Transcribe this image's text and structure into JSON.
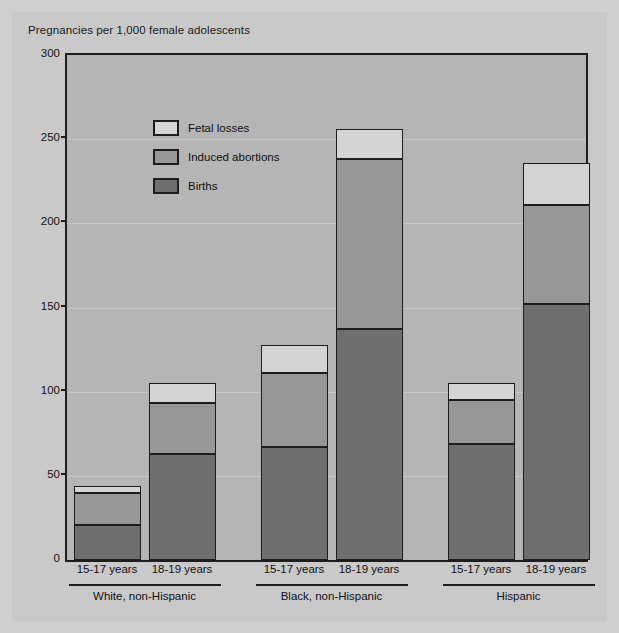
{
  "chart_data": {
    "type": "bar",
    "subtype": "stacked",
    "title": "Pregnancies per 1,000 female adolescents",
    "xlabel": "",
    "ylabel": "Pregnancies per 1,000 female adolescents",
    "ylim": [
      0,
      300
    ],
    "yticks": [
      0,
      50,
      100,
      150,
      200,
      250,
      300
    ],
    "ytick_labels": [
      "0",
      "50",
      "100",
      "150",
      "200",
      "250",
      "300"
    ],
    "grid": true,
    "legend_position": "upper-left-inside",
    "categories": [
      "15-17 years",
      "18-19 years",
      "15-17 years",
      "18-19 years",
      "15-17 years",
      "18-19 years"
    ],
    "groups": [
      {
        "label": "White, non-Hispanic",
        "categories": [
          "15-17 years",
          "18-19 years"
        ]
      },
      {
        "label": "Black, non-Hispanic",
        "categories": [
          "15-17 years",
          "18-19 years"
        ]
      },
      {
        "label": "Hispanic",
        "categories": [
          "15-17 years",
          "18-19 years"
        ]
      }
    ],
    "series": [
      {
        "name": "Births",
        "color": "#6f6f6f",
        "values": [
          21,
          63,
          67,
          137,
          69,
          152
        ]
      },
      {
        "name": "Induced abortions",
        "color": "#979797",
        "values": [
          19,
          30,
          44,
          101,
          26,
          59
        ]
      },
      {
        "name": "Fetal losses",
        "color": "#d4d4d4",
        "values": [
          4,
          12,
          17,
          18,
          10,
          25
        ]
      }
    ],
    "totals": [
      44,
      105,
      128,
      256,
      105,
      236
    ],
    "legend": [
      {
        "label": "Fetal losses",
        "color": "#d4d4d4"
      },
      {
        "label": "Induced abortions",
        "color": "#979797"
      },
      {
        "label": "Births",
        "color": "#6f6f6f"
      }
    ],
    "colors": {
      "page_background": "#c9c9c9",
      "plot_background": "#b5b5b5",
      "axis": "#1d1d1d",
      "gridline": "#c6c6c6",
      "text": "#111111"
    }
  }
}
